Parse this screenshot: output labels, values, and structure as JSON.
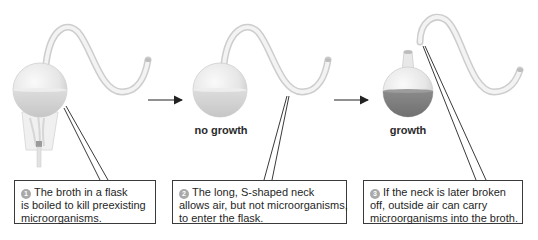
{
  "diagram": {
    "colors": {
      "glass": "#ececec",
      "glass_edge": "#c8c8c8",
      "clear_broth": "#cfcfcf",
      "cloudy_broth": "#7a7a7a",
      "outline": "#2b2b2b",
      "step_badge": "#a9a9a9"
    },
    "stages": [
      {
        "id": 1,
        "state_label": "",
        "flask": "intact swan neck, heated over flame",
        "broth": "clear",
        "callout": {
          "number": "1",
          "lines": [
            "The broth in a flask",
            "is boiled to kill preexisting",
            "microorganisms."
          ]
        }
      },
      {
        "id": 2,
        "state_label": "no growth",
        "flask": "intact swan neck",
        "broth": "clear",
        "callout": {
          "number": "2",
          "lines": [
            "The long, S-shaped neck",
            "allows air, but not microorganisms,",
            "to enter the flask."
          ]
        }
      },
      {
        "id": 3,
        "state_label": "growth",
        "flask": "neck broken off",
        "broth": "cloudy",
        "callout": {
          "number": "3",
          "lines": [
            "If the neck is later broken",
            "off, outside air can carry",
            "microorganisms into the broth."
          ]
        }
      }
    ],
    "arrows": [
      {
        "from": 1,
        "to": 2,
        "icon": "right-arrow-icon"
      },
      {
        "from": 2,
        "to": 3,
        "icon": "right-arrow-icon"
      }
    ]
  }
}
